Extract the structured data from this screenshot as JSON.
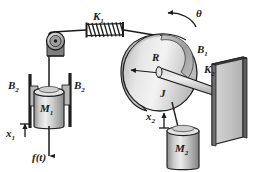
{
  "figure": {
    "background_color": "#ffffff",
    "width": 259,
    "height": 172
  },
  "palette": {
    "outline": "#1a1a1a",
    "body_light": "#d8d8d8",
    "body_mid": "#bdbdbd",
    "body_dark": "#9a9a9a",
    "body_darker": "#7d7d7d",
    "highlight": "#efefef",
    "wall_face": "#cfcfcf",
    "wall_edge": "#6e6e6e",
    "spring_color": "#262626",
    "line_color": "#1a1a1a"
  },
  "labels": {
    "spring_top": {
      "base": "K",
      "sub": "1",
      "x": 93,
      "y": 20
    },
    "theta": {
      "base": "θ",
      "sub": "",
      "x": 196,
      "y": 17
    },
    "damper_rot": {
      "base": "B",
      "sub": "1",
      "x": 197,
      "y": 53
    },
    "radius": {
      "base": "R",
      "sub": "",
      "x": 152,
      "y": 61
    },
    "inertia": {
      "base": "J",
      "sub": "",
      "x": 160,
      "y": 97
    },
    "spring_right": {
      "base": "K",
      "sub": "2",
      "x": 207,
      "y": 73
    },
    "damper_left_1": {
      "base": "B",
      "sub": "2",
      "x": 11,
      "y": 89
    },
    "damper_left_2": {
      "base": "B",
      "sub": "2",
      "x": 75,
      "y": 89
    },
    "mass_1": {
      "base": "M",
      "sub": "1",
      "x": 42,
      "y": 112
    },
    "disp_1": {
      "base": "x",
      "sub": "1",
      "x": 7,
      "y": 137
    },
    "force": {
      "base": "f(t)",
      "sub": "",
      "x": 34,
      "y": 160
    },
    "disp_2": {
      "base": "x",
      "sub": "2",
      "x": 148,
      "y": 120
    },
    "mass_2": {
      "base": "M",
      "sub": "2",
      "x": 178,
      "y": 152
    }
  },
  "components": {
    "pulley": {
      "name": "pulley",
      "cx": 56,
      "cy": 41,
      "r": 8
    },
    "spring_k1": {
      "name": "translational-spring",
      "x": 86,
      "y": 27,
      "coils": 9
    },
    "drum": {
      "name": "rotating-drum",
      "cx": 160,
      "cy": 73,
      "r": 37
    },
    "band_brake": {
      "name": "rotational-damper-band"
    },
    "rod_k2": {
      "name": "rotational-spring-rod"
    },
    "wall": {
      "name": "fixed-wall-support",
      "x": 218,
      "y": 75
    },
    "mass_m1": {
      "name": "mass-block-1",
      "cx": 48,
      "cy": 105
    },
    "mass_m2": {
      "name": "mass-block-2",
      "cx": 183,
      "cy": 145
    },
    "damper_rail_left": {
      "name": "damper-rail-left",
      "x": 29
    },
    "damper_rail_right": {
      "name": "damper-rail-right",
      "x": 71
    }
  },
  "arrows": {
    "theta_direction": "counterclockwise",
    "x1_direction": "up",
    "x2_direction": "up",
    "force_direction": "down",
    "radius_direction": "left"
  }
}
